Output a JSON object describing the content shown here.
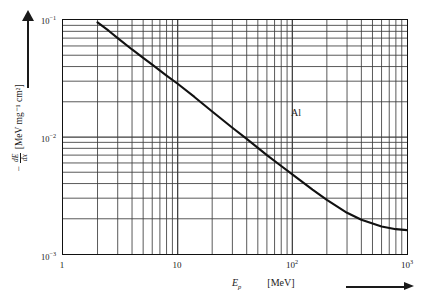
{
  "figure": {
    "y_axis": {
      "caption_prefix": "−",
      "fraction_numerator": "dE",
      "fraction_denominator": "dx",
      "unit": "[MeV mg⁻¹ cm²]",
      "arrow_icon": "up-arrow-icon",
      "ticks": [
        {
          "label_mantissa": "10",
          "label_exponent": "−1",
          "value": 0.1,
          "y_px": 19
        },
        {
          "label_mantissa": "10",
          "label_exponent": "−2",
          "value": 0.01,
          "y_px": 137
        },
        {
          "label_mantissa": "10",
          "label_exponent": "−3",
          "value": 0.001,
          "y_px": 255
        }
      ]
    },
    "x_axis": {
      "symbol": "E",
      "symbol_subscript": "p",
      "unit": "[MeV]",
      "arrow_icon": "right-arrow-icon",
      "ticks": [
        {
          "label_mantissa": "1",
          "label_exponent": "",
          "value": 1,
          "x_px": 62
        },
        {
          "label_mantissa": "10",
          "label_exponent": "",
          "value": 10,
          "x_px": 177
        },
        {
          "label_mantissa": "10",
          "label_exponent": "2",
          "value": 100,
          "x_px": 292
        },
        {
          "label_mantissa": "10",
          "label_exponent": "3",
          "value": 1000,
          "x_px": 407
        }
      ]
    },
    "annotations": [
      {
        "text": "Al",
        "x_px": 296,
        "y_px": 113
      }
    ],
    "style": {
      "grid_color": "#3c3c3c",
      "frame_color": "#111111",
      "curve_color": "#111111",
      "background": "#ffffff"
    }
  },
  "chart_data": {
    "type": "line",
    "title": "",
    "subtitle": "",
    "xlabel": "E_p  [MeV]",
    "ylabel": "−dE/dx  [MeV mg⁻¹ cm²]",
    "xscale": "log",
    "yscale": "log",
    "xlim": [
      1,
      1000
    ],
    "ylim": [
      0.001,
      0.1
    ],
    "grid": true,
    "grid_style": "log-log minor gridlines on both axes",
    "legend": "none",
    "annotations": [
      "Al"
    ],
    "series": [
      {
        "name": "Proton stopping power in aluminium",
        "x": [
          2.0,
          2.5,
          3.0,
          4.0,
          5.0,
          6.0,
          8.0,
          10,
          14,
          20,
          30,
          40,
          60,
          80,
          100,
          150,
          200,
          300,
          400,
          600,
          800,
          1000
        ],
        "y": [
          0.0955,
          0.081,
          0.07,
          0.056,
          0.0475,
          0.0415,
          0.0335,
          0.0285,
          0.022,
          0.0165,
          0.012,
          0.00965,
          0.007,
          0.00565,
          0.0048,
          0.00355,
          0.0029,
          0.00225,
          0.00196,
          0.00172,
          0.00163,
          0.0016
        ]
      }
    ]
  }
}
